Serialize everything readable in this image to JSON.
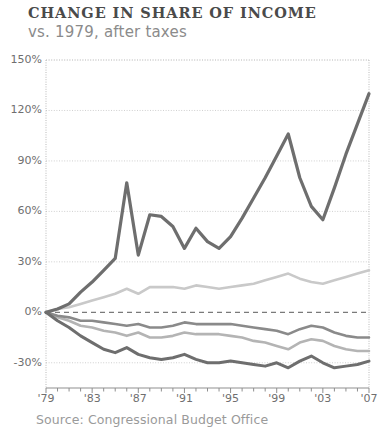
{
  "header": {
    "title": "CHANGE IN SHARE OF INCOME",
    "subtitle": "vs. 1979, after taxes"
  },
  "footer": {
    "source": "Source: Congressional Budget Office"
  },
  "colors": {
    "top_line": "#6e6e6e",
    "second_line": "#c9c9c9",
    "third_line": "#8a8a8a",
    "fourth_line": "#b4b4b4",
    "fifth_line": "#6e6e6e",
    "grid": "#cfcfcf",
    "axis": "#b9b9b9",
    "zero_dash": "#7a7a7a",
    "title_text": "#4a4a4a",
    "subtitle_text": "#8b8b8b",
    "tick_text": "#6f6f6f",
    "source_text": "#9a9a9a"
  },
  "chart_data": {
    "type": "line",
    "title": "CHANGE IN SHARE OF INCOME",
    "subtitle": "vs. 1979, after taxes",
    "xlabel": "",
    "ylabel": "",
    "xlim": [
      1979,
      2007
    ],
    "ylim": [
      -45,
      150
    ],
    "grid": true,
    "legend": "none",
    "zero_reference_line": true,
    "yticks": [
      -30,
      0,
      30,
      60,
      90,
      120,
      150
    ],
    "ytick_labels": [
      "-30%",
      "0%",
      "30%",
      "60%",
      "90%",
      "120%",
      "150%"
    ],
    "xticks": [
      1979,
      1983,
      1987,
      1991,
      1995,
      1999,
      2003,
      2007
    ],
    "xtick_labels": [
      "'79",
      "'83",
      "'87",
      "'91",
      "'95",
      "'99",
      "'03",
      "'07"
    ],
    "minor_xticks_every": 1,
    "x": [
      1979,
      1980,
      1981,
      1982,
      1983,
      1984,
      1985,
      1986,
      1987,
      1988,
      1989,
      1990,
      1991,
      1992,
      1993,
      1994,
      1995,
      1996,
      1997,
      1998,
      1999,
      2000,
      2001,
      2002,
      2003,
      2004,
      2005,
      2006,
      2007
    ],
    "series": [
      {
        "name": "Top 1%",
        "color": "#6e6e6e",
        "width": 3.2,
        "values": [
          0,
          2,
          5,
          12,
          18,
          25,
          32,
          77,
          34,
          58,
          57,
          51,
          38,
          50,
          42,
          38,
          45,
          56,
          68,
          80,
          93,
          106,
          80,
          63,
          55,
          74,
          94,
          112,
          130
        ]
      },
      {
        "name": "Highest quintile (81st-99th)",
        "color": "#c9c9c9",
        "width": 2.6,
        "values": [
          0,
          2,
          3,
          5,
          7,
          9,
          11,
          14,
          11,
          15,
          15,
          15,
          14,
          16,
          15,
          14,
          15,
          16,
          17,
          19,
          21,
          23,
          20,
          18,
          17,
          19,
          21,
          23,
          25
        ]
      },
      {
        "name": "Fourth quintile",
        "color": "#8a8a8a",
        "width": 2.6,
        "values": [
          0,
          -2,
          -3,
          -5,
          -5,
          -6,
          -7,
          -8,
          -7,
          -9,
          -9,
          -8,
          -6,
          -7,
          -7,
          -7,
          -7,
          -8,
          -9,
          -10,
          -11,
          -13,
          -10,
          -8,
          -9,
          -12,
          -14,
          -15,
          -15
        ]
      },
      {
        "name": "Middle quintile",
        "color": "#b4b4b4",
        "width": 2.6,
        "values": [
          0,
          -3,
          -5,
          -8,
          -9,
          -11,
          -12,
          -14,
          -12,
          -15,
          -15,
          -14,
          -12,
          -13,
          -13,
          -13,
          -14,
          -15,
          -17,
          -18,
          -20,
          -22,
          -18,
          -16,
          -17,
          -20,
          -22,
          -23,
          -23
        ]
      },
      {
        "name": "Lowest quintile",
        "color": "#6e6e6e",
        "width": 3.0,
        "values": [
          0,
          -5,
          -9,
          -14,
          -18,
          -22,
          -24,
          -21,
          -25,
          -27,
          -28,
          -27,
          -25,
          -28,
          -30,
          -30,
          -29,
          -30,
          -31,
          -32,
          -30,
          -33,
          -29,
          -26,
          -30,
          -33,
          -32,
          -31,
          -29
        ]
      }
    ]
  }
}
